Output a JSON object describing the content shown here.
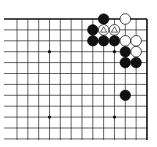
{
  "board": {
    "description": "Partial Go board diagram, top-right corner",
    "origin_x": 17,
    "origin_y": 19,
    "spacing_x": 10.83,
    "spacing_y": 10.9,
    "columns": 13,
    "rows": 12,
    "right_edge_closed": true,
    "top_edge_closed": true,
    "line_color": "#222222",
    "edge_color": "#111111",
    "background": "#ffffff",
    "star_points": [
      {
        "col": 3,
        "row": 3
      },
      {
        "col": 9,
        "row": 3
      },
      {
        "col": 3,
        "row": 9
      },
      {
        "col": 9,
        "row": 9
      }
    ],
    "stones": [
      {
        "col": 8,
        "row": 0,
        "color": "black"
      },
      {
        "col": 10,
        "row": 0,
        "color": "white"
      },
      {
        "col": 7,
        "row": 1,
        "color": "black"
      },
      {
        "col": 8,
        "row": 1,
        "color": "white",
        "mark": "triangle"
      },
      {
        "col": 9,
        "row": 1,
        "color": "white",
        "mark": "triangle"
      },
      {
        "col": 7,
        "row": 2,
        "color": "black"
      },
      {
        "col": 8,
        "row": 2,
        "color": "black"
      },
      {
        "col": 9,
        "row": 2,
        "color": "black"
      },
      {
        "col": 10,
        "row": 2,
        "color": "white"
      },
      {
        "col": 11,
        "row": 2,
        "color": "white"
      },
      {
        "col": 10,
        "row": 3,
        "color": "black"
      },
      {
        "col": 11,
        "row": 3,
        "color": "white"
      },
      {
        "col": 10,
        "row": 4,
        "color": "black"
      },
      {
        "col": 11,
        "row": 4,
        "color": "black"
      },
      {
        "col": 10,
        "row": 7,
        "color": "black"
      }
    ]
  }
}
